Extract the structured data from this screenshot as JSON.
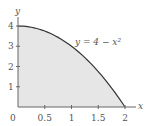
{
  "chart_data": {
    "type": "area",
    "title": "",
    "function_label": "y = 4 − x²",
    "xlabel": "x",
    "ylabel": "y",
    "xlim": [
      0,
      2
    ],
    "ylim": [
      0,
      4
    ],
    "x_ticks": [
      "0.5",
      "1",
      "1.5",
      "2"
    ],
    "y_ticks": [
      "1",
      "2",
      "3",
      "4"
    ],
    "origin_label": "0",
    "x": [
      0,
      0.25,
      0.5,
      0.75,
      1,
      1.25,
      1.5,
      1.75,
      2
    ],
    "values": [
      4,
      3.9375,
      3.75,
      3.4375,
      3,
      2.4375,
      1.75,
      0.9375,
      0
    ],
    "fill_color": "#e6e6e6",
    "curve_color": "#333333",
    "grid": false
  }
}
